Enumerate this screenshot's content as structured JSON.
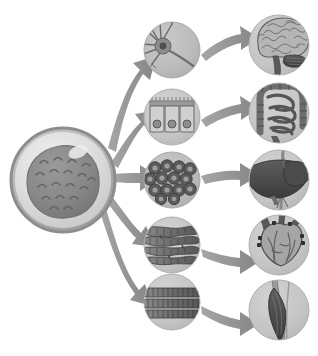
{
  "figure": {
    "background_color": "#ffffff",
    "width": 318,
    "height": 356
  },
  "palette": {
    "circle_bg": "#b9b9b9",
    "circle_bg_light": "#c6c6c6",
    "arrow_fill": "#8f8f8f",
    "arrow_fill_light": "#9c9c9c",
    "cell_membrane": "#a8a8a8",
    "cell_membrane_light": "#d2d2d2",
    "nucleus": "#8a8a8a",
    "nucleus_dark": "#6e6e6e",
    "organ_dark": "#4a4a4a",
    "organ_mid": "#7d7d7d",
    "outline": "#5c5c5c"
  },
  "source": {
    "name": "stem-cell",
    "label": "Stem cell",
    "description": "Undifferentiated stem cell with outer membrane ring and large textured nucleus",
    "center": [
      63,
      180
    ],
    "radius": 52
  },
  "pathways": [
    {
      "id": "neural",
      "cell": {
        "name": "neuron",
        "label": "Neuron",
        "description": "Nerve cell with dendrites, soma and long axon with terminal branches",
        "center": [
          172,
          50
        ],
        "radius": 28
      },
      "organ": {
        "name": "brain",
        "label": "Brain",
        "description": "Cerebrum with gyri and sulci, cerebellum and brainstem",
        "center": [
          279,
          45
        ],
        "radius": 30
      }
    },
    {
      "id": "epithelial",
      "cell": {
        "name": "epithelial-cells",
        "label": "Epithelial cells",
        "description": "Three columnar epithelial cells with microvilli border and round nuclei",
        "center": [
          172,
          117
        ],
        "radius": 28
      },
      "organ": {
        "name": "intestines",
        "label": "Intestines",
        "description": "Large intestine framing coiled small intestine loops",
        "center": [
          279,
          113
        ],
        "radius": 30
      }
    },
    {
      "id": "hepatic",
      "cell": {
        "name": "hepatocytes",
        "label": "Hepatocytes",
        "description": "Cluster of rounded liver cells each with a dark nucleus",
        "center": [
          172,
          180
        ],
        "radius": 28
      },
      "organ": {
        "name": "liver",
        "label": "Liver",
        "description": "Dark liver lobes with vessels crossing vertically",
        "center": [
          279,
          180
        ],
        "radius": 30
      }
    },
    {
      "id": "cardiac",
      "cell": {
        "name": "cardiac-muscle-fibers",
        "label": "Cardiac muscle fibers",
        "description": "Branching interconnected striated cardiac fibers",
        "center": [
          172,
          245
        ],
        "radius": 28
      },
      "organ": {
        "name": "heart",
        "label": "Heart",
        "description": "Heart with great vessels branching at the top",
        "center": [
          279,
          245
        ],
        "radius": 30
      }
    },
    {
      "id": "skeletal",
      "cell": {
        "name": "skeletal-muscle-fibers",
        "label": "Skeletal muscle fibers",
        "description": "Parallel unbranched striated skeletal muscle fibers",
        "center": [
          172,
          302
        ],
        "radius": 28
      },
      "organ": {
        "name": "skeletal-muscle",
        "label": "Skeletal muscle",
        "description": "Spindle shaped muscle belly with tendons at each end",
        "center": [
          279,
          310
        ],
        "radius": 30
      }
    }
  ],
  "arrows": {
    "primary_count": 5,
    "secondary_count": 5,
    "style": "tapered curved arrow",
    "color": "#8f8f8f"
  }
}
